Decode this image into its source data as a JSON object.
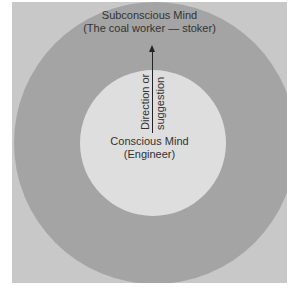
{
  "diagram": {
    "outer_circle": {
      "title": "Subconscious Mind",
      "subtitle": "(The coal worker — stoker)"
    },
    "inner_circle": {
      "title": "Conscious Mind",
      "subtitle": "(Engineer)"
    },
    "arrow": {
      "direction": "up",
      "label_left": "Direction or",
      "label_right": "suggestion"
    },
    "colors": {
      "background": "#c8c8c8",
      "outer_ring": "#a4a4a4",
      "inner_circle": "#dedede",
      "text": "#333333"
    }
  }
}
